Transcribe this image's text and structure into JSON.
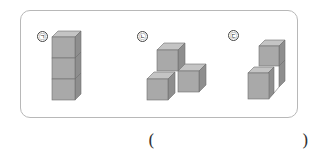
{
  "figures": [
    {
      "label": "㉠",
      "shape": "three cubes stacked vertically"
    },
    {
      "label": "㉡",
      "shape": "four cubes in T arrangement"
    },
    {
      "label": "㉢",
      "shape": "three cubes in step arrangement"
    }
  ],
  "answer": {
    "open": "(",
    "close": ")",
    "value": ""
  },
  "colors": {
    "front": "#a9a9a9",
    "top": "#c4c4c4",
    "side": "#8e8e8e",
    "edge": "#6f6f6f",
    "border": "#b8b8b8"
  }
}
